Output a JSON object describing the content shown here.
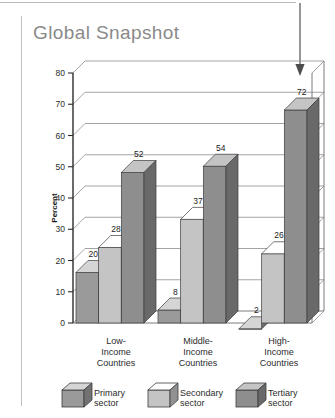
{
  "page": {
    "title": "Global Snapshot"
  },
  "annotation": {
    "arrow": "down-arrow-callout",
    "target_value": "72"
  },
  "chart_data": {
    "type": "bar",
    "title": "Global Snapshot",
    "xlabel": "",
    "ylabel": "Percent",
    "ylim": [
      0,
      80
    ],
    "yticks": [
      "0",
      "10",
      "20",
      "30",
      "40",
      "50",
      "60",
      "70",
      "80"
    ],
    "grid": true,
    "legend_position": "bottom",
    "style": "3d-grouped-columns",
    "categories": [
      "Low-\nIncome\nCountries",
      "Middle-\nIncome\nCountries",
      "High-\nIncome\nCountries"
    ],
    "category_lines": [
      [
        "Low-",
        "Income",
        "Countries"
      ],
      [
        "Middle-",
        "Income",
        "Countries"
      ],
      [
        "High-",
        "Income",
        "Countries"
      ]
    ],
    "series": [
      {
        "name": "Primary sector",
        "values": [
          20,
          8,
          2
        ],
        "color": "#9a9a9a"
      },
      {
        "name": "Secondary sector",
        "values": [
          28,
          37,
          26
        ],
        "color": "#c4c4c4"
      },
      {
        "name": "Tertiary sector",
        "values": [
          52,
          54,
          72
        ],
        "color": "#8e8e8e"
      }
    ]
  },
  "legend": {
    "items": [
      {
        "label_line1": "Primary",
        "label_line2": "sector"
      },
      {
        "label_line1": "Secondary",
        "label_line2": "sector"
      },
      {
        "label_line1": "Tertiary",
        "label_line2": "sector"
      }
    ]
  },
  "colors": {
    "title": "#8a8a8a",
    "axis": "#3a3a3a",
    "grid": "#6e6e6e",
    "primary_face": "#9a9a9a",
    "secondary_face": "#c4c4c4",
    "tertiary_face": "#8e8e8e",
    "top_face_light": "#d8d8d8",
    "side_face_dark": "#6d6d6d"
  }
}
